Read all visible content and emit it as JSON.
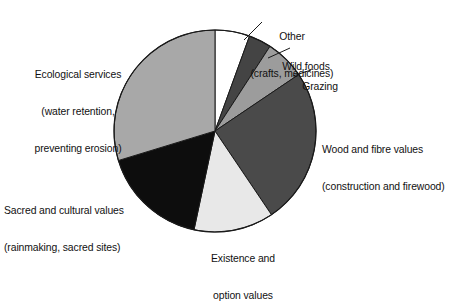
{
  "figure": {
    "title": "",
    "background": "#ffffff"
  },
  "chart_data": {
    "type": "pie",
    "title": "",
    "xlabel": "",
    "ylabel": "",
    "legend_position": "callout-labels",
    "grid": false,
    "start_angle_deg": 0,
    "direction": "clockwise",
    "outline_color": "#1a1a1a",
    "categories": [
      "Other (crafts, medicines)",
      "Wild foods",
      "Grazing",
      "Wood and fibre values (construction and firewood)",
      "Existence and option values",
      "Sacred and cultural values (rainmaking, sacred sites)",
      "Ecological services (water retention, preventing erosion)"
    ],
    "values": [
      5.6,
      3.6,
      6.4,
      25.0,
      12.8,
      16.9,
      29.7
    ],
    "unit": "percent",
    "angles_deg": [
      20,
      13,
      23,
      90,
      46,
      61,
      107
    ],
    "colors": [
      "#ffffff",
      "#444444",
      "#9c9c9c",
      "#4a4a4a",
      "#e8e8e8",
      "#0d0d0d",
      "#a8a8a8"
    ],
    "slices": [
      {
        "name": "Other",
        "label_lines": [
          "Other",
          "(crafts, medicines)"
        ],
        "value": 5.6,
        "angle_deg": 20,
        "color": "#ffffff"
      },
      {
        "name": "Wild foods",
        "label_lines": [
          "Wild foods"
        ],
        "value": 3.6,
        "angle_deg": 13,
        "color": "#444444"
      },
      {
        "name": "Grazing",
        "label_lines": [
          "Grazing"
        ],
        "value": 6.4,
        "angle_deg": 23,
        "color": "#9c9c9c"
      },
      {
        "name": "Wood and fibre values",
        "label_lines": [
          "Wood and fibre values",
          "(construction and firewood)"
        ],
        "value": 25.0,
        "angle_deg": 90,
        "color": "#4a4a4a"
      },
      {
        "name": "Existence and option values",
        "label_lines": [
          "Existence and",
          "option values"
        ],
        "value": 12.8,
        "angle_deg": 46,
        "color": "#e8e8e8"
      },
      {
        "name": "Sacred and cultural values",
        "label_lines": [
          "Sacred and cultural values",
          "(rainmaking, sacred sites)"
        ],
        "value": 16.9,
        "angle_deg": 61,
        "color": "#0d0d0d"
      },
      {
        "name": "Ecological services",
        "label_lines": [
          "Ecological services",
          "(water retention,",
          "preventing erosion)"
        ],
        "value": 29.7,
        "angle_deg": 107,
        "color": "#a8a8a8"
      }
    ]
  },
  "labels": {
    "other_line1": "Other",
    "other_line2": "(crafts, medicines)",
    "wild_foods": "Wild foods",
    "grazing": "Grazing",
    "wood_line1": "Wood and fibre values",
    "wood_line2": "(construction and firewood)",
    "existence_line1": "Existence and",
    "existence_line2": "option values",
    "sacred_line1": "Sacred and cultural values",
    "sacred_line2": "(rainmaking, sacred sites)",
    "ecological_line1": "Ecological services",
    "ecological_line2": "(water retention,",
    "ecological_line3": "preventing erosion)"
  }
}
